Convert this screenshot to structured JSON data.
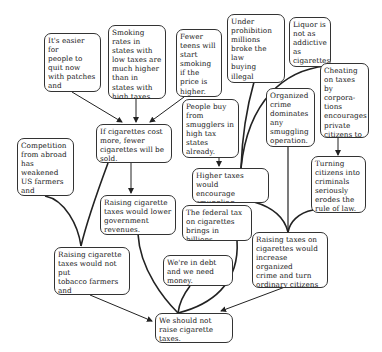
{
  "diagram": {
    "type": "argument-map",
    "nodes": {
      "n_easier": "It's easier for\npeople to\nquit now\nwith patches\nand\ncounseling.",
      "n_smoking_rates": "Smoking\nrates in\nstates with\nlow taxes are\nmuch higher\nthan in\nstates with\nhigh taxes.",
      "n_fewer_teens": "Fewer\nteens will\nstart\nsmoking\nif the\nprice is\nhigher.",
      "n_prohibition": "Under\nprohibition\nmillions\nbroke the law\nbuying illegal\nliquor.",
      "n_liquor": "Liquor is\nnot as\naddictive\nas\ncigarettes.",
      "n_cheating": "Cheating\non taxes by\ncorpora-\ntions\nencourages\nprivate\ncitizens to\ncheat.",
      "n_cost_more": "If cigarettes cost\nmore, fewer\ncigarettes will be\nsold.",
      "n_people_buy": "People buy\nfrom\nsmugglers in\nhigh tax\nstates\nalready.",
      "n_organized": "Organized\ncrime\ndominates\nany\nsmuggling\noperation.",
      "n_competition": "Competition\nfrom abroad\nhas weakened\nUS farmers\nand\nproducers.",
      "n_higher_taxes": "Higher taxes would\nencourage\nsmuggling.",
      "n_turning": "Turning\ncitizens into\ncriminals\nseriously\nerodes the\nrule of law.",
      "n_lower_revenue": "Raising cigarette\ntaxes would lower\ngovernment\nrevenues.",
      "n_federal_tax": "The federal tax\non cigarettes\nbrings in billions\nof dollars.",
      "n_increase_crime": "Raising taxes on\ncigarettes would\nincrease organized\ncrime and turn\nordinary citizens\ninto criminals.",
      "n_not_put": "Raising cigarette\ntaxes would not put\ntobacco farmers and\ncompanies out\nof business.",
      "n_debt": "We're in debt\nand we need\nmoney.",
      "n_conclusion": "We should not\nraise cigarette\ntaxes."
    },
    "edges": [
      {
        "from": "n_easier",
        "to": "n_cost_more",
        "type": "arrow"
      },
      {
        "from": "n_smoking_rates",
        "to": "n_cost_more",
        "type": "arrow"
      },
      {
        "from": "n_fewer_teens",
        "to": "n_cost_more",
        "type": "arrow"
      },
      {
        "from": "n_cost_more",
        "to": "n_lower_revenue",
        "type": "arrow"
      },
      {
        "from": "n_people_buy",
        "to": "n_higher_taxes",
        "type": "arrow"
      },
      {
        "from": "n_prohibition",
        "to": "n_higher_taxes",
        "type": "join"
      },
      {
        "from": "n_liquor",
        "to": "n_higher_taxes",
        "type": "join"
      },
      {
        "from": "n_cheating",
        "to": "n_turning",
        "type": "arrow"
      },
      {
        "from": "n_higher_taxes",
        "to": "n_increase_crime",
        "type": "join"
      },
      {
        "from": "n_organized",
        "to": "n_increase_crime",
        "type": "join"
      },
      {
        "from": "n_turning",
        "to": "n_increase_crime",
        "type": "join"
      },
      {
        "from": "n_cost_more",
        "to": "n_not_put",
        "type": "join"
      },
      {
        "from": "n_competition",
        "to": "n_not_put",
        "type": "join"
      },
      {
        "from": "n_lower_revenue",
        "to": "n_conclusion",
        "type": "join"
      },
      {
        "from": "n_federal_tax",
        "to": "n_conclusion",
        "type": "join"
      },
      {
        "from": "n_debt",
        "to": "n_conclusion",
        "type": "join"
      },
      {
        "from": "n_not_put",
        "to": "n_conclusion",
        "type": "arrow"
      },
      {
        "from": "n_increase_crime",
        "to": "n_conclusion",
        "type": "arrow"
      }
    ]
  }
}
